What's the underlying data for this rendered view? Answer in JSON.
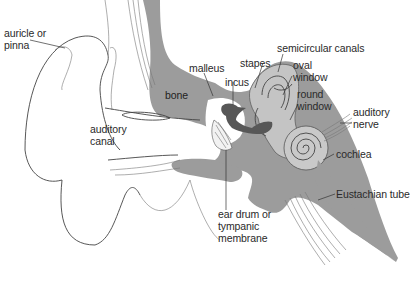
{
  "diagram": {
    "colors": {
      "bone": "#9c9c9c",
      "ossicles": "#575757",
      "inner_ear": "#c4c4c4",
      "outline": "#444444",
      "background": "#ffffff",
      "text": "#2a2a2a"
    },
    "labels": [
      {
        "id": "auricle",
        "text": "auricle or\npinna"
      },
      {
        "id": "auditory_canal",
        "text": "auditory\ncanal"
      },
      {
        "id": "bone",
        "text": "bone"
      },
      {
        "id": "malleus",
        "text": "malleus"
      },
      {
        "id": "incus",
        "text": "incus"
      },
      {
        "id": "stapes",
        "text": "stapes"
      },
      {
        "id": "semicircular_canals",
        "text": "semicircular canals"
      },
      {
        "id": "oval_window",
        "text": "oval\nwindow"
      },
      {
        "id": "round_window",
        "text": "round\nwindow"
      },
      {
        "id": "auditory_nerve",
        "text": "auditory\nnerve"
      },
      {
        "id": "cochlea",
        "text": "cochlea"
      },
      {
        "id": "eustachian_tube",
        "text": "Eustachian tube"
      },
      {
        "id": "ear_drum",
        "text": "ear drum or\ntympanic\nmembrane"
      }
    ]
  }
}
